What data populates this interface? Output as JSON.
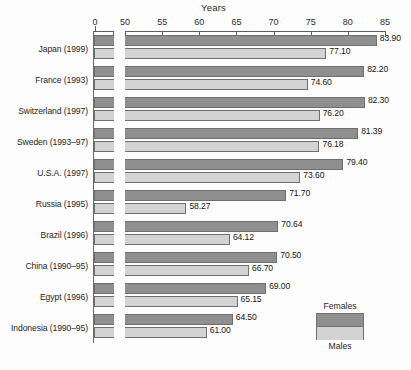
{
  "chart_data": {
    "type": "bar",
    "title": "Years",
    "xlabel": "Years",
    "ylabel": "",
    "orientation": "horizontal",
    "grid": false,
    "axis_break": true,
    "xlim": [
      50,
      85
    ],
    "x_origin_tick": "0",
    "xticks": [
      "0",
      "50",
      "55",
      "60",
      "65",
      "70",
      "75",
      "80",
      "85"
    ],
    "xtick_values": [
      0,
      50,
      55,
      60,
      65,
      70,
      75,
      80,
      85
    ],
    "legend_position": "bottom-right",
    "categories": [
      "Japan (1999)",
      "France (1993)",
      "Switzerland (1997)",
      "Sweden (1993–97)",
      "U.S.A. (1997)",
      "Russia (1995)",
      "Brazil (1996)",
      "China (1990–95)",
      "Egypt (1996)",
      "Indonesia (1990–95)"
    ],
    "series": [
      {
        "name": "Females",
        "color": "#8f8f8f",
        "values": [
          83.9,
          82.2,
          82.3,
          81.39,
          79.4,
          71.7,
          70.64,
          70.5,
          69.0,
          64.5
        ],
        "labels": [
          "83.90",
          "82.20",
          "82.30",
          "81.39",
          "79.40",
          "71.70",
          "70.64",
          "70.50",
          "69.00",
          "64.50"
        ]
      },
      {
        "name": "Males",
        "color": "#d3d3d3",
        "values": [
          77.1,
          74.6,
          76.2,
          76.18,
          73.6,
          58.27,
          64.12,
          66.7,
          65.15,
          61.0
        ],
        "labels": [
          "77.10",
          "74.60",
          "76.20",
          "76.18",
          "73.60",
          "58.27",
          "64.12",
          "66.70",
          "65.15",
          "61.00"
        ]
      }
    ]
  },
  "legend": {
    "top_label": "Females",
    "bottom_label": "Males"
  }
}
